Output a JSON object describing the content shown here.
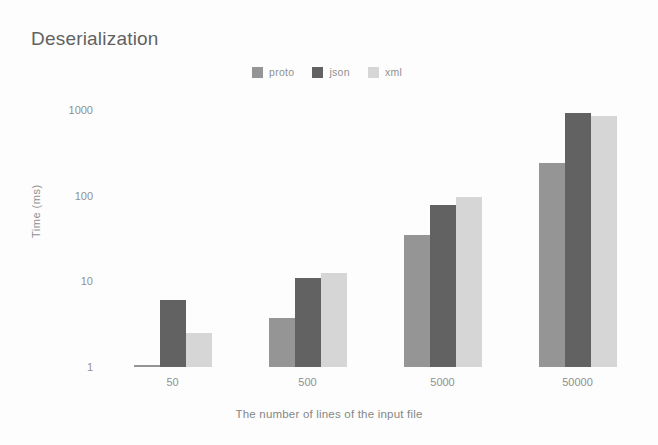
{
  "chart_data": {
    "type": "bar",
    "title": "Deserialization",
    "xlabel": "The number of lines of the input file",
    "ylabel": "Time (ms)",
    "categories": [
      "50",
      "500",
      "5000",
      "50000"
    ],
    "series": [
      {
        "name": "proto",
        "color": "#8f8f8f",
        "values": [
          1,
          3.7,
          35,
          240
        ]
      },
      {
        "name": "json",
        "color": "#595959",
        "values": [
          6,
          11,
          78,
          930
        ]
      },
      {
        "name": "xml",
        "color": "#d4d4d4",
        "values": [
          2.5,
          12.5,
          97,
          860
        ]
      }
    ],
    "yscale": "log",
    "ylim": [
      1,
      1000
    ],
    "yticks": [
      "1",
      "10",
      "100",
      "1000"
    ],
    "grid": false,
    "legend_position": "top-center"
  }
}
